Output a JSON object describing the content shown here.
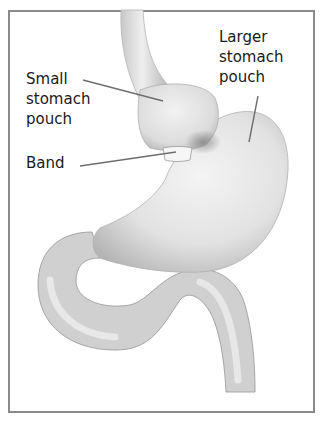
{
  "figure": {
    "type": "anatomical-illustration",
    "border_color": "#8a8a8a",
    "labels": [
      {
        "id": "small-pouch",
        "text": "Small\nstomach\npouch"
      },
      {
        "id": "band",
        "text": "Band"
      },
      {
        "id": "larger-pouch",
        "text": "Larger\nstomach\npouch"
      }
    ]
  }
}
